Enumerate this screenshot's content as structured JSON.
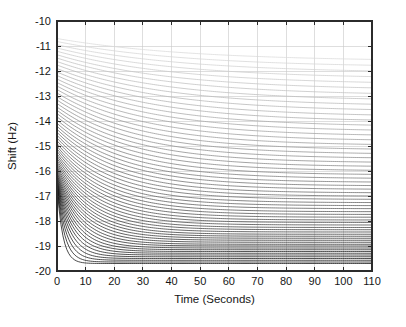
{
  "chart_data": {
    "type": "line",
    "title": "",
    "xlabel": "Time (Seconds)",
    "ylabel": "Shift (Hz)",
    "xlim": [
      0,
      110
    ],
    "ylim": [
      -20,
      -10
    ],
    "xticks": [
      0,
      10,
      20,
      30,
      40,
      50,
      60,
      70,
      80,
      90,
      100,
      110
    ],
    "yticks": [
      -20,
      -19,
      -18,
      -17,
      -16,
      -15,
      -14,
      -13,
      -12,
      -11,
      -10
    ],
    "xticklabels": [
      "0",
      "10",
      "20",
      "30",
      "40",
      "50",
      "60",
      "70",
      "80",
      "90",
      "100",
      "110"
    ],
    "yticklabels": [
      "-20",
      "-19",
      "-18",
      "-17",
      "-16",
      "-15",
      "-14",
      "-13",
      "-12",
      "-11",
      "-10"
    ],
    "grid": true,
    "legend": false,
    "legend_position": "none",
    "tick_direction": "in",
    "series_count": 60,
    "series_description": "Family of exponential decay curves of frequency shift versus time; each curve starts at an initial shift between -10.7 Hz and -16.0 Hz at t = 0 s and relaxes toward an asymptotic plateau between -11.6 Hz and -19.7 Hz by t = 110 s. Curve gray level darkens progressively from the topmost (lightest) to the lowest (darkest) trace.",
    "series": [
      {
        "name": "curve-01",
        "y0": -10.7,
        "yinf": -11.62,
        "tau": 46.0,
        "color": "#d9d9d9"
      },
      {
        "name": "curve-02",
        "y0": -10.82,
        "yinf": -11.86,
        "tau": 45.0,
        "color": "#d5d5d5"
      },
      {
        "name": "curve-03",
        "y0": -10.95,
        "yinf": -12.09,
        "tau": 44.0,
        "color": "#d1d1d1"
      },
      {
        "name": "curve-04",
        "y0": -11.08,
        "yinf": -12.32,
        "tau": 43.0,
        "color": "#cdcdcd"
      },
      {
        "name": "curve-05",
        "y0": -11.21,
        "yinf": -12.55,
        "tau": 42.0,
        "color": "#c9c9c9"
      },
      {
        "name": "curve-06",
        "y0": -11.35,
        "yinf": -12.77,
        "tau": 41.0,
        "color": "#c4c4c4"
      },
      {
        "name": "curve-07",
        "y0": -11.48,
        "yinf": -12.99,
        "tau": 40.0,
        "color": "#c0c0c0"
      },
      {
        "name": "curve-08",
        "y0": -11.62,
        "yinf": -13.21,
        "tau": 39.0,
        "color": "#bcbcbc"
      },
      {
        "name": "curve-09",
        "y0": -11.76,
        "yinf": -13.42,
        "tau": 38.0,
        "color": "#b8b8b8"
      },
      {
        "name": "curve-10",
        "y0": -11.9,
        "yinf": -13.63,
        "tau": 37.0,
        "color": "#b4b4b4"
      },
      {
        "name": "curve-11",
        "y0": -12.04,
        "yinf": -13.84,
        "tau": 36.0,
        "color": "#b0b0b0"
      },
      {
        "name": "curve-12",
        "y0": -12.18,
        "yinf": -14.04,
        "tau": 35.0,
        "color": "#acacac"
      },
      {
        "name": "curve-13",
        "y0": -12.32,
        "yinf": -14.24,
        "tau": 34.0,
        "color": "#a8a8a8"
      },
      {
        "name": "curve-14",
        "y0": -12.46,
        "yinf": -14.43,
        "tau": 33.0,
        "color": "#a4a4a4"
      },
      {
        "name": "curve-15",
        "y0": -12.6,
        "yinf": -14.62,
        "tau": 32.0,
        "color": "#a0a0a0"
      },
      {
        "name": "curve-16",
        "y0": -12.74,
        "yinf": -14.81,
        "tau": 31.0,
        "color": "#9c9c9c"
      },
      {
        "name": "curve-17",
        "y0": -12.88,
        "yinf": -14.99,
        "tau": 30.0,
        "color": "#989898"
      },
      {
        "name": "curve-18",
        "y0": -13.02,
        "yinf": -15.17,
        "tau": 29.2,
        "color": "#949494"
      },
      {
        "name": "curve-19",
        "y0": -13.16,
        "yinf": -15.34,
        "tau": 28.4,
        "color": "#909090"
      },
      {
        "name": "curve-20",
        "y0": -13.3,
        "yinf": -15.51,
        "tau": 27.6,
        "color": "#8c8c8c"
      },
      {
        "name": "curve-21",
        "y0": -13.44,
        "yinf": -15.68,
        "tau": 26.8,
        "color": "#888888"
      },
      {
        "name": "curve-22",
        "y0": -13.57,
        "yinf": -15.84,
        "tau": 26.0,
        "color": "#848484"
      },
      {
        "name": "curve-23",
        "y0": -13.7,
        "yinf": -16.0,
        "tau": 25.2,
        "color": "#808080"
      },
      {
        "name": "curve-24",
        "y0": -13.83,
        "yinf": -16.16,
        "tau": 24.5,
        "color": "#7c7c7c"
      },
      {
        "name": "curve-25",
        "y0": -13.96,
        "yinf": -16.31,
        "tau": 23.8,
        "color": "#787878"
      },
      {
        "name": "curve-26",
        "y0": -14.09,
        "yinf": -16.46,
        "tau": 23.1,
        "color": "#747474"
      },
      {
        "name": "curve-27",
        "y0": -14.21,
        "yinf": -16.6,
        "tau": 22.4,
        "color": "#707070"
      },
      {
        "name": "curve-28",
        "y0": -14.33,
        "yinf": -16.74,
        "tau": 21.7,
        "color": "#6c6c6c"
      },
      {
        "name": "curve-29",
        "y0": -14.45,
        "yinf": -16.88,
        "tau": 21.0,
        "color": "#686868"
      },
      {
        "name": "curve-30",
        "y0": -14.57,
        "yinf": -17.01,
        "tau": 20.3,
        "color": "#656565"
      },
      {
        "name": "curve-31",
        "y0": -14.68,
        "yinf": -17.14,
        "tau": 19.6,
        "color": "#616161"
      },
      {
        "name": "curve-32",
        "y0": -14.79,
        "yinf": -17.27,
        "tau": 18.9,
        "color": "#5d5d5d"
      },
      {
        "name": "curve-33",
        "y0": -14.9,
        "yinf": -17.39,
        "tau": 18.2,
        "color": "#595959"
      },
      {
        "name": "curve-34",
        "y0": -15.01,
        "yinf": -17.51,
        "tau": 17.6,
        "color": "#555555"
      },
      {
        "name": "curve-35",
        "y0": -15.11,
        "yinf": -17.63,
        "tau": 17.0,
        "color": "#525252"
      },
      {
        "name": "curve-36",
        "y0": -15.21,
        "yinf": -17.74,
        "tau": 16.4,
        "color": "#4e4e4e"
      },
      {
        "name": "curve-37",
        "y0": -15.31,
        "yinf": -17.85,
        "tau": 15.8,
        "color": "#4a4a4a"
      },
      {
        "name": "curve-38",
        "y0": -15.4,
        "yinf": -17.96,
        "tau": 15.2,
        "color": "#474747"
      },
      {
        "name": "curve-39",
        "y0": -15.49,
        "yinf": -18.06,
        "tau": 14.6,
        "color": "#434343"
      },
      {
        "name": "curve-40",
        "y0": -15.58,
        "yinf": -18.16,
        "tau": 14.0,
        "color": "#404040"
      },
      {
        "name": "curve-41",
        "y0": -15.66,
        "yinf": -18.26,
        "tau": 13.4,
        "color": "#3c3c3c"
      },
      {
        "name": "curve-42",
        "y0": -15.74,
        "yinf": -18.35,
        "tau": 12.8,
        "color": "#393939"
      },
      {
        "name": "curve-43",
        "y0": -15.82,
        "yinf": -18.44,
        "tau": 12.2,
        "color": "#363636"
      },
      {
        "name": "curve-44",
        "y0": -15.89,
        "yinf": -18.53,
        "tau": 11.6,
        "color": "#333333"
      },
      {
        "name": "curve-45",
        "y0": -15.96,
        "yinf": -18.61,
        "tau": 11.0,
        "color": "#303030"
      },
      {
        "name": "curve-46",
        "y0": -16.03,
        "yinf": -18.69,
        "tau": 10.4,
        "color": "#2d2d2d"
      },
      {
        "name": "curve-47",
        "y0": -16.09,
        "yinf": -18.77,
        "tau": 9.8,
        "color": "#2a2a2a"
      },
      {
        "name": "curve-48",
        "y0": -16.15,
        "yinf": -18.85,
        "tau": 9.2,
        "color": "#282828"
      },
      {
        "name": "curve-49",
        "y0": -16.2,
        "yinf": -18.93,
        "tau": 8.6,
        "color": "#252525"
      },
      {
        "name": "curve-50",
        "y0": -16.25,
        "yinf": -19.0,
        "tau": 8.0,
        "color": "#232323"
      },
      {
        "name": "curve-51",
        "y0": -16.3,
        "yinf": -19.08,
        "tau": 7.4,
        "color": "#202020"
      },
      {
        "name": "curve-52",
        "y0": -16.35,
        "yinf": -19.15,
        "tau": 6.8,
        "color": "#1e1e1e"
      },
      {
        "name": "curve-53",
        "y0": -16.39,
        "yinf": -19.22,
        "tau": 6.2,
        "color": "#1c1c1c"
      },
      {
        "name": "curve-54",
        "y0": -16.43,
        "yinf": -19.29,
        "tau": 5.6,
        "color": "#1a1a1a"
      },
      {
        "name": "curve-55",
        "y0": -16.46,
        "yinf": -19.36,
        "tau": 5.0,
        "color": "#181818"
      },
      {
        "name": "curve-56",
        "y0": -16.49,
        "yinf": -19.43,
        "tau": 4.4,
        "color": "#161616"
      },
      {
        "name": "curve-57",
        "y0": -16.52,
        "yinf": -19.5,
        "tau": 3.8,
        "color": "#141414"
      },
      {
        "name": "curve-58",
        "y0": -16.55,
        "yinf": -19.57,
        "tau": 3.2,
        "color": "#121212"
      },
      {
        "name": "curve-59",
        "y0": -16.57,
        "yinf": -19.64,
        "tau": 2.6,
        "color": "#101010"
      },
      {
        "name": "curve-60",
        "y0": -16.59,
        "yinf": -19.7,
        "tau": 2.0,
        "color": "#0e0e0e"
      }
    ]
  },
  "axes": {
    "grid_color": "#c8c8c8",
    "axis_color": "#2b2b2b",
    "background_color": "#ffffff"
  },
  "plot_box": {
    "left": 57,
    "top": 21,
    "right": 372,
    "bottom": 271
  }
}
